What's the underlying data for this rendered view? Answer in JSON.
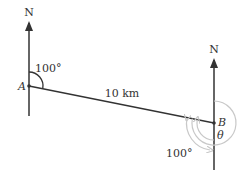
{
  "diagram": {
    "type": "bearing-diagram",
    "points": [
      {
        "id": "A",
        "label": "A"
      },
      {
        "id": "B",
        "label": "B"
      }
    ],
    "north_labels": {
      "at_A": "N",
      "at_B": "N"
    },
    "segment": {
      "from": "A",
      "to": "B",
      "length_label": "10 km"
    },
    "angles": {
      "at_A": {
        "label": "100°",
        "description": "bearing of B from A, measured clockwise from north"
      },
      "at_B_alternate": {
        "label": "100°",
        "description": "alternate angle from south at B"
      },
      "at_B_unknown": {
        "label": "θ",
        "description": "reflex bearing of A from B, measured clockwise from north"
      }
    },
    "colors": {
      "line": "#333333",
      "arc_gray": "#c8c8c8",
      "text": "#333333"
    }
  }
}
